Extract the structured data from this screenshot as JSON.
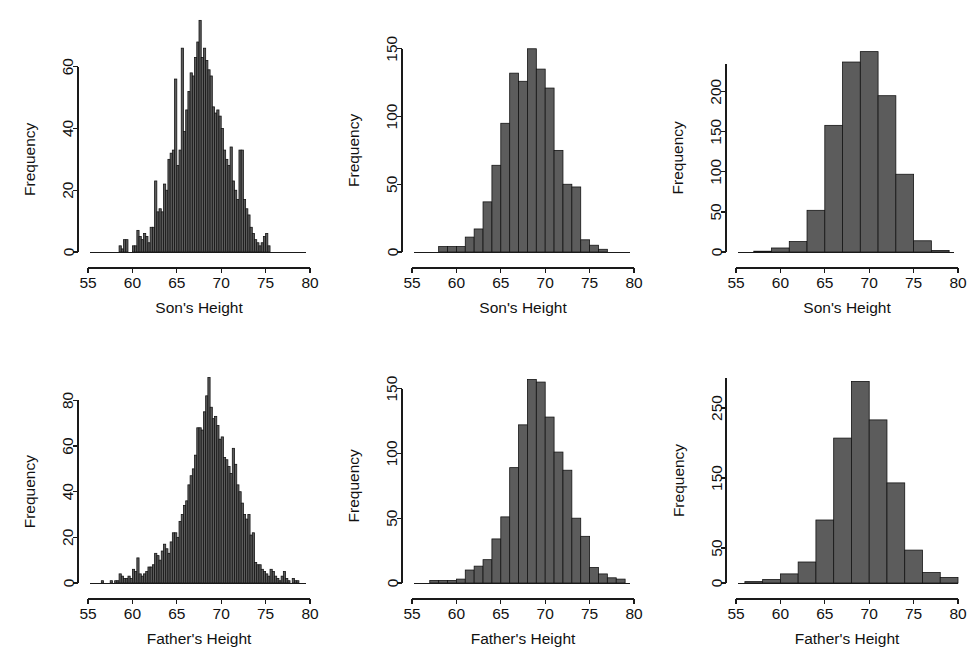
{
  "figure": {
    "title": "",
    "background_color": "#ffffff",
    "bar_fill_color": "#5c5c5c",
    "bar_edge_color": "#141414",
    "axis_color": "#1a1a1a",
    "rows": 2,
    "cols": 3
  },
  "chart_data": [
    {
      "id": "sons-height-fine",
      "panel_position": "top-left",
      "type": "bar",
      "title": "",
      "subtitle": "",
      "xlabel": "Son's Height",
      "ylabel": "Frequency",
      "xlim": [
        55,
        80
      ],
      "ylim": [
        0,
        68
      ],
      "xticks": [
        55,
        60,
        65,
        70,
        75,
        80
      ],
      "yticks": [
        0,
        20,
        40,
        60
      ],
      "grid": false,
      "legend": "none",
      "bin_width": 0.25,
      "bin_starts": [
        58.5,
        58.75,
        59.0,
        59.25,
        59.5,
        59.75,
        60.0,
        60.25,
        60.5,
        60.75,
        61.0,
        61.25,
        61.5,
        61.75,
        62.0,
        62.25,
        62.5,
        62.75,
        63.0,
        63.25,
        63.5,
        63.75,
        64.0,
        64.25,
        64.5,
        64.75,
        65.0,
        65.25,
        65.5,
        65.75,
        66.0,
        66.25,
        66.5,
        66.75,
        67.0,
        67.25,
        67.5,
        67.75,
        68.0,
        68.25,
        68.5,
        68.75,
        69.0,
        69.25,
        69.5,
        69.75,
        70.0,
        70.25,
        70.5,
        70.75,
        71.0,
        71.25,
        71.5,
        71.75,
        72.0,
        72.25,
        72.5,
        72.75,
        73.0,
        73.25,
        73.5,
        73.75,
        74.0,
        74.25,
        74.5,
        74.75,
        75.0,
        75.25
      ],
      "values": [
        2,
        1,
        4,
        4,
        0,
        0,
        2,
        2,
        7,
        5,
        4,
        6,
        5,
        3,
        8,
        8,
        23,
        13,
        14,
        13,
        22,
        20,
        30,
        32,
        33,
        56,
        28,
        33,
        66,
        39,
        46,
        52,
        58,
        57,
        63,
        68,
        75,
        63,
        66,
        62,
        59,
        57,
        47,
        45,
        46,
        44,
        40,
        33,
        30,
        28,
        34,
        23,
        20,
        17,
        33,
        33,
        17,
        14,
        12,
        8,
        6,
        4,
        3,
        2,
        3,
        5,
        6,
        2
      ]
    },
    {
      "id": "sons-height-medium",
      "panel_position": "top-middle",
      "type": "bar",
      "title": "",
      "subtitle": "",
      "xlabel": "Son's Height",
      "ylabel": "Frequency",
      "xlim": [
        55,
        80
      ],
      "ylim": [
        0,
        155
      ],
      "xticks": [
        55,
        60,
        65,
        70,
        75,
        80
      ],
      "yticks": [
        0,
        50,
        100,
        150
      ],
      "grid": false,
      "legend": "none",
      "bin_width": 1,
      "bin_starts": [
        58,
        59,
        60,
        61,
        62,
        63,
        64,
        65,
        66,
        67,
        68,
        69,
        70,
        71,
        72,
        73,
        74,
        75,
        76
      ],
      "values": [
        4,
        4,
        4,
        11,
        17,
        37,
        64,
        95,
        132,
        126,
        150,
        135,
        121,
        75,
        50,
        48,
        9,
        5,
        2
      ]
    },
    {
      "id": "sons-height-coarse",
      "panel_position": "top-right",
      "type": "bar",
      "title": "",
      "subtitle": "",
      "xlabel": "Son's Height",
      "ylabel": "Frequency",
      "xlim": [
        55,
        80
      ],
      "ylim": [
        0,
        262
      ],
      "xticks": [
        55,
        60,
        65,
        70,
        75,
        80
      ],
      "yticks": [
        0,
        50,
        100,
        150,
        200
      ],
      "grid": false,
      "legend": "none",
      "bin_width": 2,
      "bin_starts": [
        57,
        59,
        61,
        63,
        65,
        67,
        69,
        71,
        73,
        75,
        77
      ],
      "values": [
        1,
        5,
        13,
        52,
        158,
        237,
        250,
        195,
        97,
        14,
        2
      ]
    },
    {
      "id": "fathers-height-fine",
      "panel_position": "bottom-left",
      "type": "bar",
      "title": "",
      "subtitle": "",
      "xlabel": "Father's Height",
      "ylabel": "Frequency",
      "xlim": [
        55,
        80
      ],
      "ylim": [
        0,
        92
      ],
      "xticks": [
        55,
        60,
        65,
        70,
        75,
        80
      ],
      "yticks": [
        0,
        20,
        40,
        60,
        80
      ],
      "grid": false,
      "legend": "none",
      "bin_width": 0.25,
      "bin_starts": [
        56.5,
        56.75,
        57.0,
        57.25,
        57.5,
        57.75,
        58.0,
        58.25,
        58.5,
        58.75,
        59.0,
        59.25,
        59.5,
        59.75,
        60.0,
        60.25,
        60.5,
        60.75,
        61.0,
        61.25,
        61.5,
        61.75,
        62.0,
        62.25,
        62.5,
        62.75,
        63.0,
        63.25,
        63.5,
        63.75,
        64.0,
        64.25,
        64.5,
        64.75,
        65.0,
        65.25,
        65.5,
        65.75,
        66.0,
        66.25,
        66.5,
        66.75,
        67.0,
        67.25,
        67.5,
        67.75,
        68.0,
        68.25,
        68.5,
        68.75,
        69.0,
        69.25,
        69.5,
        69.75,
        70.0,
        70.25,
        70.5,
        70.75,
        71.0,
        71.25,
        71.5,
        71.75,
        72.0,
        72.25,
        72.5,
        72.75,
        73.0,
        73.25,
        73.5,
        73.75,
        74.0,
        74.25,
        74.5,
        74.75,
        75.0,
        75.25,
        75.5,
        75.75,
        76.0,
        76.25,
        76.5,
        76.75,
        77.0,
        77.25,
        77.5,
        77.75,
        78.0,
        78.25,
        78.5
      ],
      "values": [
        1,
        0,
        0,
        0,
        1,
        0,
        1,
        1,
        4,
        3,
        2,
        2,
        3,
        2,
        6,
        5,
        11,
        4,
        3,
        4,
        5,
        7,
        7,
        8,
        13,
        12,
        10,
        14,
        17,
        15,
        13,
        18,
        22,
        22,
        20,
        27,
        30,
        34,
        36,
        43,
        47,
        50,
        56,
        68,
        68,
        67,
        75,
        82,
        90,
        77,
        72,
        73,
        69,
        63,
        64,
        55,
        54,
        51,
        48,
        59,
        52,
        43,
        40,
        35,
        30,
        28,
        30,
        21,
        22,
        9,
        8,
        8,
        6,
        5,
        4,
        3,
        6,
        5,
        3,
        2,
        1,
        3,
        5,
        2,
        1,
        0,
        2,
        1,
        1
      ]
    },
    {
      "id": "fathers-height-medium",
      "panel_position": "bottom-middle",
      "type": "bar",
      "title": "",
      "subtitle": "",
      "xlabel": "Father's Height",
      "ylabel": "Frequency",
      "xlim": [
        55,
        80
      ],
      "ylim": [
        0,
        162
      ],
      "xticks": [
        55,
        60,
        65,
        70,
        75,
        80
      ],
      "yticks": [
        0,
        50,
        100,
        150
      ],
      "grid": false,
      "legend": "none",
      "bin_width": 1,
      "bin_starts": [
        57,
        58,
        59,
        60,
        61,
        62,
        63,
        64,
        65,
        66,
        67,
        68,
        69,
        70,
        71,
        72,
        73,
        74,
        75,
        76,
        77,
        78
      ],
      "values": [
        2,
        2,
        2,
        3,
        10,
        13,
        18,
        34,
        51,
        89,
        122,
        157,
        155,
        128,
        101,
        87,
        50,
        36,
        12,
        7,
        4,
        3
      ]
    },
    {
      "id": "fathers-height-coarse",
      "panel_position": "bottom-right",
      "type": "bar",
      "title": "",
      "subtitle": "",
      "xlabel": "Father's Height",
      "ylabel": "Frequency",
      "xlim": [
        55,
        80
      ],
      "ylim": [
        0,
        300
      ],
      "xticks": [
        55,
        60,
        65,
        70,
        75,
        80
      ],
      "yticks": [
        0,
        50,
        150,
        250
      ],
      "grid": false,
      "legend": "none",
      "bin_width": 2,
      "bin_starts": [
        56,
        58,
        60,
        62,
        64,
        66,
        68,
        70,
        72,
        74,
        76,
        78
      ],
      "values": [
        2,
        5,
        13,
        30,
        90,
        207,
        288,
        233,
        143,
        47,
        15,
        8
      ]
    }
  ]
}
